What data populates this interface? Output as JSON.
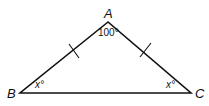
{
  "diagram": {
    "type": "isosceles-triangle",
    "vertices": [
      {
        "name": "A",
        "x": 108,
        "y": 22
      },
      {
        "name": "B",
        "x": 20,
        "y": 93
      },
      {
        "name": "C",
        "x": 191,
        "y": 93
      }
    ],
    "labels": {
      "A": "A",
      "B": "B",
      "C": "C"
    },
    "angles": {
      "A": "100°",
      "B": "x°",
      "C": "x°"
    },
    "congruence_marks": [
      "AB",
      "AC"
    ],
    "stroke_color": "#111111"
  }
}
